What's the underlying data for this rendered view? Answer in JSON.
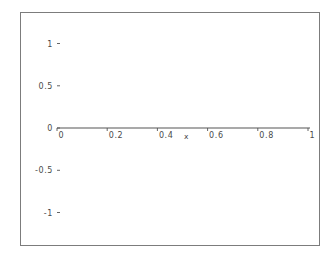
{
  "figure": {
    "background_color": "#ffffff",
    "frame_color": "#7c7c7c",
    "curve_color": "#8a8a8a",
    "axis_color": "#555555",
    "text_color": "#4a4a4a"
  },
  "chart_data": {
    "type": "line",
    "title": "",
    "subtitle": "",
    "xlabel": "x",
    "ylabel": "",
    "xlim": [
      0,
      1
    ],
    "ylim": [
      -1,
      1
    ],
    "grid": false,
    "legend": null,
    "legend_position": "none",
    "x_ticks": [
      0,
      0.2,
      0.4,
      0.6,
      0.8,
      1
    ],
    "x_tick_labels": [
      "0",
      "0.2",
      "0.4",
      "0.6",
      "0.8",
      "1"
    ],
    "y_ticks": [
      -1,
      -0.5,
      0,
      0.5,
      1
    ],
    "y_tick_labels": [
      "-1",
      "-0.5",
      "0",
      "0.5",
      "1"
    ],
    "function": "sin(c/x) style swept-frequency oscillation",
    "amplitude": 1,
    "series": [
      {
        "name": "chirp",
        "color": "#8a8a8a",
        "sample_count": 4000,
        "x_start": 0.0,
        "x_end": 1.0,
        "phase_coefficient": 1.45,
        "notable_points": [
          {
            "x": 0.363,
            "y": -1,
            "kind": "minimum"
          },
          {
            "x": 0.405,
            "y": 0,
            "kind": "zero-crossing-rising"
          },
          {
            "x": 0.455,
            "y": 1,
            "kind": "maximum"
          },
          {
            "x": 0.52,
            "y": 0,
            "kind": "zero-crossing-falling"
          },
          {
            "x": 0.58,
            "y": -1,
            "kind": "minimum"
          },
          {
            "x": 0.62,
            "y": 0,
            "kind": "zero-crossing-rising"
          },
          {
            "x": 0.672,
            "y": 1,
            "kind": "maximum"
          },
          {
            "x": 0.772,
            "y": 0,
            "kind": "zero-crossing-falling"
          },
          {
            "x": 0.888,
            "y": -1,
            "kind": "minimum"
          },
          {
            "x": 1.0,
            "y": 0.1,
            "kind": "endpoint"
          }
        ]
      }
    ]
  }
}
